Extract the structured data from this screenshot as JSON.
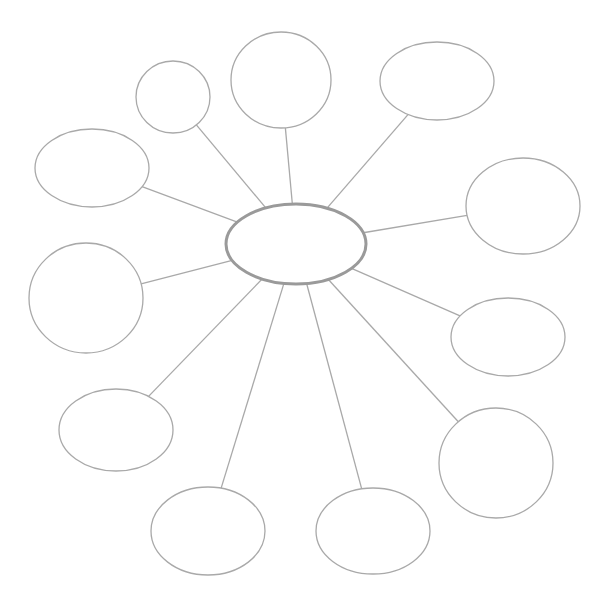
{
  "diagram": {
    "type": "bubble-map",
    "center": {
      "label": ""
    },
    "nodes": [
      {
        "id": "n1",
        "label": ""
      },
      {
        "id": "n2",
        "label": ""
      },
      {
        "id": "n3",
        "label": ""
      },
      {
        "id": "n4",
        "label": ""
      },
      {
        "id": "n5",
        "label": ""
      },
      {
        "id": "n6",
        "label": ""
      },
      {
        "id": "n7",
        "label": ""
      },
      {
        "id": "n8",
        "label": ""
      },
      {
        "id": "n9",
        "label": ""
      },
      {
        "id": "n10",
        "label": ""
      },
      {
        "id": "n11",
        "label": ""
      }
    ],
    "colors": {
      "stroke": "#a9a9a9",
      "center_stroke": "#9a9a9a",
      "fill": "#ffffff"
    }
  }
}
